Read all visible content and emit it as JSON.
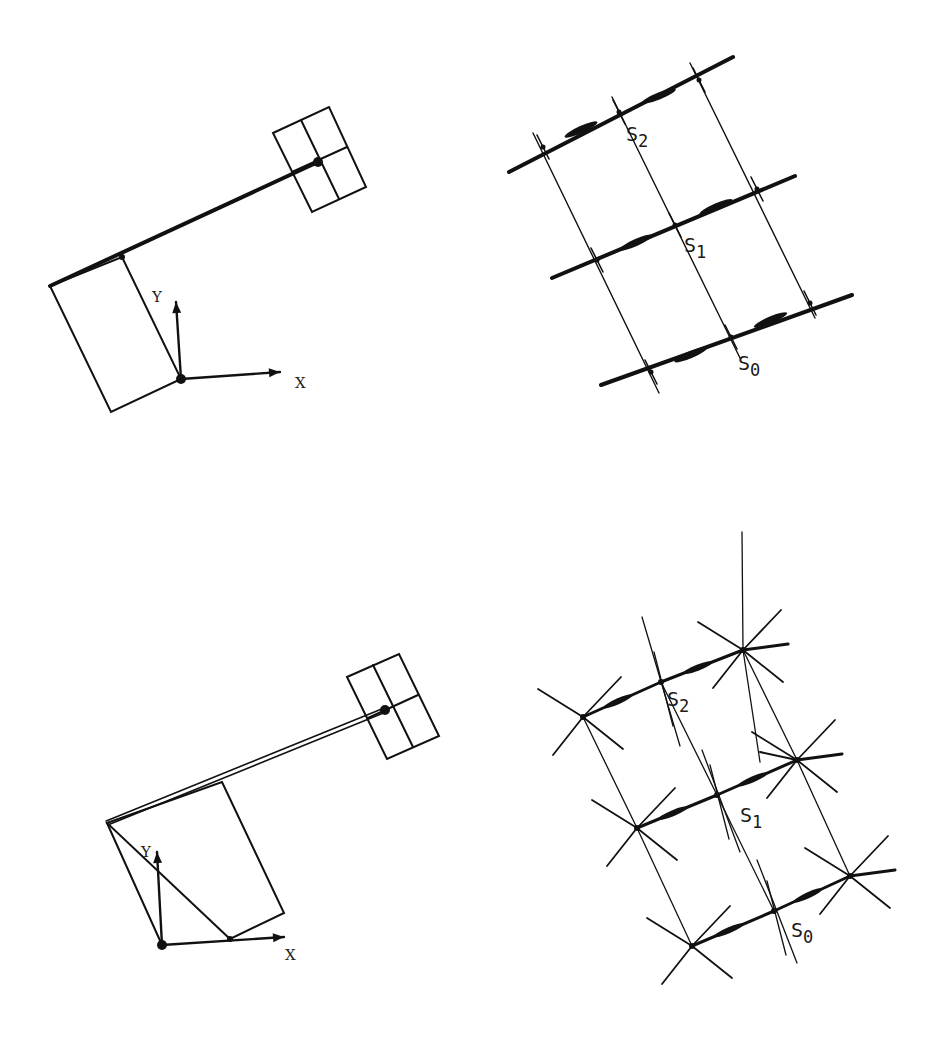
{
  "panels": [
    {
      "id": "top-left-arm",
      "kind": "arm",
      "axis_labels": {
        "x": "X",
        "y": "Y"
      },
      "origin": [
        181,
        379
      ],
      "x_axis_tip": [
        280,
        372
      ],
      "y_axis_tip": [
        176,
        302
      ],
      "base_box": [
        [
          50,
          286
        ],
        [
          122,
          257
        ],
        [
          181,
          379
        ],
        [
          111,
          412
        ]
      ],
      "link": {
        "from": [
          50,
          286
        ],
        "to": [
          318,
          162
        ],
        "double": false,
        "width": 4
      },
      "joint_dots": [
        [
          122,
          257
        ],
        [
          318,
          162
        ]
      ],
      "gripper": {
        "corners": [
          [
            273,
            133
          ],
          [
            329,
            107
          ],
          [
            366,
            187
          ],
          [
            312,
            212
          ]
        ],
        "mid_a": [
          [
            301,
            120
          ],
          [
            339,
            199
          ]
        ],
        "mid_b": [
          [
            292,
            172
          ],
          [
            347,
            147
          ]
        ]
      },
      "x_label_pos": [
        295,
        388
      ],
      "y_label_pos": [
        152,
        302
      ]
    },
    {
      "id": "top-right-lattice",
      "kind": "lattice",
      "rows": [
        {
          "label": "S2",
          "nodes": [
            [
              543,
              147
            ],
            [
              619,
              112
            ],
            [
              699,
              80
            ]
          ],
          "ext_left": [
            509,
            172
          ],
          "ext_right": [
            733,
            57
          ],
          "label_pos": [
            626,
            141
          ]
        },
        {
          "label": "S1",
          "nodes": [
            [
              597,
              260
            ],
            [
              675,
              225
            ],
            [
              757,
              189
            ]
          ],
          "ext_left": [
            552,
            278
          ],
          "ext_right": [
            795,
            176
          ],
          "label_pos": [
            684,
            252
          ]
        },
        {
          "label": "S0",
          "nodes": [
            [
              651,
              372
            ],
            [
              731,
              337
            ],
            [
              810,
              303
            ]
          ],
          "ext_left": [
            601,
            385
          ],
          "ext_right": [
            852,
            295
          ],
          "label_pos": [
            738,
            370
          ]
        }
      ],
      "columns_extend": [
        [
          [
            533,
            133
          ],
          [
            659,
            393
          ]
        ],
        [
          [
            612,
            97
          ],
          [
            740,
            358
          ]
        ],
        [
          [
            690,
            63
          ],
          [
            815,
            318
          ]
        ]
      ]
    },
    {
      "id": "bottom-left-arm",
      "kind": "arm",
      "axis_labels": {
        "x": "X",
        "y": "Y"
      },
      "origin": [
        162,
        945
      ],
      "x_axis_tip": [
        284,
        937
      ],
      "y_axis_tip": [
        157,
        852
      ],
      "base_box": [
        [
          107,
          823
        ],
        [
          222,
          782
        ],
        [
          284,
          913
        ],
        [
          230,
          939
        ]
      ],
      "base_box_close": [
        [
          107,
          823
        ],
        [
          162,
          945
        ]
      ],
      "link": {
        "from": [
          107,
          823
        ],
        "to": [
          385,
          710
        ],
        "double": true,
        "width": 2
      },
      "joint_dots": [
        [
          230,
          939
        ],
        [
          385,
          710
        ]
      ],
      "gripper": {
        "corners": [
          [
            347,
            677
          ],
          [
            399,
            654
          ],
          [
            439,
            736
          ],
          [
            387,
            759
          ]
        ],
        "mid_a": [
          [
            373,
            665
          ],
          [
            413,
            747
          ]
        ],
        "mid_b": [
          [
            368,
            718
          ],
          [
            418,
            695
          ]
        ]
      },
      "x_label_pos": [
        285,
        960
      ],
      "y_label_pos": [
        141,
        857
      ]
    },
    {
      "id": "bottom-right-lattice",
      "kind": "star-lattice",
      "rows": [
        {
          "label": "S2",
          "nodes": [
            [
              583,
              717
            ],
            [
              661,
              682
            ],
            [
              743,
              650
            ]
          ],
          "label_pos": [
            667,
            706
          ]
        },
        {
          "label": "S1",
          "nodes": [
            [
              637,
              828
            ],
            [
              717,
              795
            ],
            [
              797,
              760
            ]
          ],
          "label_pos": [
            740,
            822
          ]
        },
        {
          "label": "S0",
          "nodes": [
            [
              692,
              946
            ],
            [
              774,
              911
            ],
            [
              850,
              876
            ]
          ],
          "label_pos": [
            791,
            937
          ]
        }
      ]
    }
  ],
  "colors": {
    "ink": "#111111",
    "paper": "#ffffff"
  }
}
